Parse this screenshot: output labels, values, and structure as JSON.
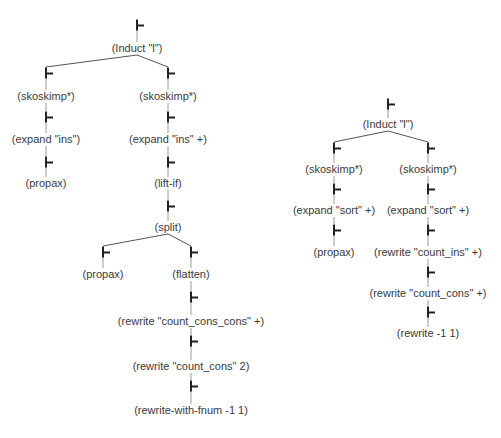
{
  "turnstile_glyph": "⊢",
  "colors": {
    "background": "#ffffff",
    "text": "#3a3a3a",
    "turnstile": "#222222",
    "edge": "#555555",
    "stem": "#9a9a9a"
  },
  "trees": [
    {
      "name": "left-proof-tree",
      "nodes": [
        {
          "id": "L0",
          "label": "(Induct \"l\")",
          "x": 137,
          "ts_y": 25,
          "label_y": 48,
          "parent": null
        },
        {
          "id": "L1",
          "label": "(skoskimp*)",
          "x": 46,
          "ts_y": 73,
          "label_y": 96,
          "parent": "L0"
        },
        {
          "id": "L2",
          "label": "(expand \"ins\")",
          "x": 46,
          "ts_y": 117,
          "label_y": 139,
          "parent": "L1"
        },
        {
          "id": "L3",
          "label": "(propax)",
          "x": 46,
          "ts_y": 162,
          "label_y": 183,
          "parent": "L2"
        },
        {
          "id": "L4",
          "label": "(skoskimp*)",
          "x": 168,
          "ts_y": 73,
          "label_y": 96,
          "parent": "L0"
        },
        {
          "id": "L5",
          "label": "(expand \"ins\" +)",
          "x": 168,
          "ts_y": 117,
          "label_y": 139,
          "parent": "L4"
        },
        {
          "id": "L6",
          "label": "(lift-if)",
          "x": 168,
          "ts_y": 162,
          "label_y": 183,
          "parent": "L5"
        },
        {
          "id": "L7",
          "label": "(split)",
          "x": 168,
          "ts_y": 206,
          "label_y": 227,
          "parent": "L6"
        },
        {
          "id": "L8",
          "label": "(propax)",
          "x": 103,
          "ts_y": 252,
          "label_y": 274,
          "parent": "L7"
        },
        {
          "id": "L9",
          "label": "(flatten)",
          "x": 191,
          "ts_y": 252,
          "label_y": 274,
          "parent": "L7"
        },
        {
          "id": "L10",
          "label": "(rewrite \"count_cons_cons\" +)",
          "x": 191,
          "ts_y": 297,
          "label_y": 321,
          "parent": "L9"
        },
        {
          "id": "L11",
          "label": "(rewrite \"count_cons\" 2)",
          "x": 191,
          "ts_y": 341,
          "label_y": 366,
          "parent": "L10"
        },
        {
          "id": "L12",
          "label": "(rewrite-with-fnum -1 1)",
          "x": 191,
          "ts_y": 386,
          "label_y": 410,
          "parent": "L11"
        }
      ]
    },
    {
      "name": "right-proof-tree",
      "nodes": [
        {
          "id": "R0",
          "label": "(Induct \"l\")",
          "x": 388,
          "ts_y": 104,
          "label_y": 124,
          "parent": null
        },
        {
          "id": "R1",
          "label": "(skoskimp*)",
          "x": 334,
          "ts_y": 148,
          "label_y": 169,
          "parent": "R0"
        },
        {
          "id": "R2",
          "label": "(expand \"sort\" +)",
          "x": 334,
          "ts_y": 189,
          "label_y": 210,
          "parent": "R1"
        },
        {
          "id": "R3",
          "label": "(propax)",
          "x": 334,
          "ts_y": 230,
          "label_y": 252,
          "parent": "R2"
        },
        {
          "id": "R4",
          "label": "(skoskimp*)",
          "x": 428,
          "ts_y": 148,
          "label_y": 169,
          "parent": "R0"
        },
        {
          "id": "R5",
          "label": "(expand \"sort\" +)",
          "x": 428,
          "ts_y": 189,
          "label_y": 210,
          "parent": "R4"
        },
        {
          "id": "R6",
          "label": "(rewrite \"count_ins\" +)",
          "x": 428,
          "ts_y": 230,
          "label_y": 252,
          "parent": "R5"
        },
        {
          "id": "R7",
          "label": "(rewrite \"count_cons\" +)",
          "x": 428,
          "ts_y": 272,
          "label_y": 293,
          "parent": "R6"
        },
        {
          "id": "R8",
          "label": "(rewrite -1 1)",
          "x": 428,
          "ts_y": 312,
          "label_y": 333,
          "parent": "R7"
        }
      ]
    }
  ]
}
